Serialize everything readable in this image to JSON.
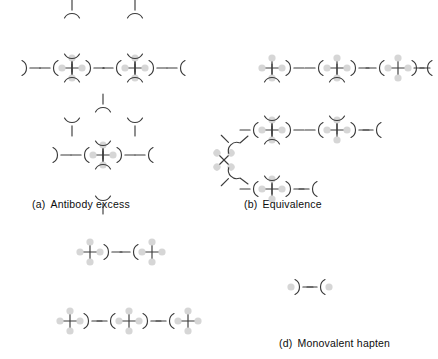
{
  "figure": {
    "stroke_color": "#3c3c3c",
    "epitope_color": "#d4d4d4",
    "text_color": "#0d0d0d",
    "background": "#ffffff"
  },
  "panels": [
    {
      "id": "a",
      "tag": "(a)",
      "label": "Antibody excess",
      "description": "Antigens saturated with excess free antibody; only small complexes form",
      "antigen_count": 3,
      "antibody_count": 11
    },
    {
      "id": "b",
      "tag": "(b)",
      "label": "Equivalence",
      "description": "Optimal antigen to antibody ratio producing a large cross-linked lattice",
      "antigen_count": 7,
      "antibody_count": 14
    },
    {
      "id": "c",
      "tag": "",
      "label": "",
      "description": "Antigen excess; short chains of antigen bridged by single antibodies",
      "antigen_count": 5,
      "antibody_count": 3
    },
    {
      "id": "d",
      "tag": "(d)",
      "label": "Monovalent hapten",
      "description": "Single antibody with both binding sites occupied by monovalent hapten; no lattice",
      "antigen_count": 0,
      "antibody_count": 1,
      "hapten_count": 2
    }
  ],
  "legend": {
    "antigen": "multivalent antigen (cross with four epitopes)",
    "antibody": "bivalent antibody (Y / bracket shape)",
    "epitope": "epitope / antigenic determinant (grey dot)",
    "hapten": "monovalent hapten (grey dot)"
  }
}
